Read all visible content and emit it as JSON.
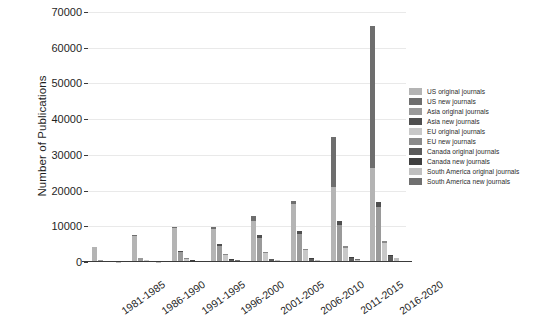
{
  "chart_data": {
    "type": "bar",
    "title": "",
    "xlabel": "",
    "ylabel": "Number of Publications",
    "ylim": [
      0,
      70000
    ],
    "yticks": [
      0,
      10000,
      20000,
      30000,
      40000,
      50000,
      60000,
      70000
    ],
    "ytick_labels": [
      "0",
      "10000",
      "20000",
      "30000",
      "40000",
      "50000",
      "60000",
      "70000"
    ],
    "grid": true,
    "stacked": true,
    "legend_position": "right",
    "categories": [
      "1981-1985",
      "1986-1990",
      "1991-1995",
      "1996-2000",
      "2001-2005",
      "2006-2010",
      "2011-2015",
      "2016-2020"
    ],
    "series": [
      {
        "name": "US original journals",
        "color": "#b4b4b4",
        "values": [
          4100,
          7300,
          9400,
          9200,
          11600,
          16300,
          21000,
          26400
        ]
      },
      {
        "name": "US new journals",
        "color": "#6e6e6e",
        "values": [
          0,
          150,
          400,
          700,
          1300,
          900,
          14100,
          39600
        ]
      },
      {
        "name": "Asia original journals",
        "color": "#9a9a9a",
        "values": [
          600,
          1000,
          2900,
          4400,
          6600,
          7900,
          10400,
          15300
        ]
      },
      {
        "name": "Asia new journals",
        "color": "#4f4f4f",
        "values": [
          0,
          100,
          300,
          600,
          900,
          700,
          1100,
          1600
        ]
      },
      {
        "name": "EU original journals",
        "color": "#c8c8c8",
        "values": [
          300,
          500,
          900,
          2000,
          2400,
          3300,
          4000,
          5300
        ]
      },
      {
        "name": "EU new journals",
        "color": "#8a8a8a",
        "values": [
          0,
          50,
          100,
          200,
          300,
          250,
          400,
          700
        ]
      },
      {
        "name": "Canada original journals",
        "color": "#5a5a5a",
        "values": [
          150,
          250,
          400,
          700,
          800,
          900,
          1100,
          1700
        ]
      },
      {
        "name": "Canada new journals",
        "color": "#3f3f3f",
        "values": [
          0,
          30,
          60,
          100,
          150,
          120,
          200,
          350
        ]
      },
      {
        "name": "South America original journals",
        "color": "#c0c0c0",
        "values": [
          60,
          120,
          200,
          350,
          450,
          500,
          700,
          1000
        ]
      },
      {
        "name": "South America new journals",
        "color": "#707070",
        "values": [
          0,
          20,
          40,
          80,
          120,
          100,
          150,
          250
        ]
      }
    ],
    "regions": [
      {
        "name": "US",
        "original": "US original journals",
        "new": "US new journals"
      },
      {
        "name": "Asia",
        "original": "Asia original journals",
        "new": "Asia new journals"
      },
      {
        "name": "EU",
        "original": "EU original journals",
        "new": "EU new journals"
      },
      {
        "name": "Canada",
        "original": "Canada original journals",
        "new": "Canada new journals"
      },
      {
        "name": "South America",
        "original": "South America original journals",
        "new": "South America new journals"
      }
    ]
  },
  "legend": {
    "items": [
      {
        "label": "US original journals",
        "color": "#b4b4b4"
      },
      {
        "label": "US new journals",
        "color": "#6e6e6e"
      },
      {
        "label": "Asia original journals",
        "color": "#9a9a9a"
      },
      {
        "label": "Asia new journals",
        "color": "#4f4f4f"
      },
      {
        "label": "EU original journals",
        "color": "#c8c8c8"
      },
      {
        "label": "EU new journals",
        "color": "#8a8a8a"
      },
      {
        "label": "Canada original journals",
        "color": "#5a5a5a"
      },
      {
        "label": "Canada new journals",
        "color": "#3f3f3f"
      },
      {
        "label": "South America original journals",
        "color": "#c0c0c0"
      },
      {
        "label": "South America new journals",
        "color": "#707070"
      }
    ]
  }
}
